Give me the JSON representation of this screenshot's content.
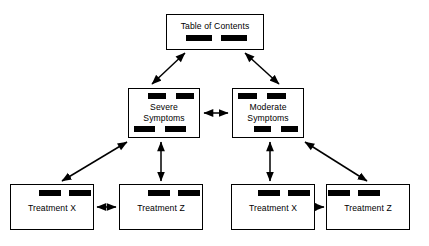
{
  "diagram": {
    "type": "hierarchy-tree",
    "background_color": "#ffffff",
    "line_color": "#000000",
    "bar_color": "#000000",
    "nodes": {
      "toc": {
        "label": "Table of Contents",
        "bars_top": 0,
        "bars_bottom": 2
      },
      "severe": {
        "label": "Severe\nSymptoms",
        "bars_top": 2,
        "bars_bottom": 2
      },
      "moderate": {
        "label": "Moderate\nSymptoms",
        "bars_top": 2,
        "bars_bottom": 2
      },
      "treatment_x_left": {
        "label": "Treatment X",
        "bars_top": 2,
        "bars_bottom": 0
      },
      "treatment_z_left": {
        "label": "Treatment Z",
        "bars_top": 2,
        "bars_bottom": 0
      },
      "treatment_x_right": {
        "label": "Treatment X",
        "bars_top": 2,
        "bars_bottom": 0
      },
      "treatment_z_right": {
        "label": "Treatment Z",
        "bars_top": 2,
        "bars_bottom": 0
      }
    },
    "connections": [
      {
        "from": "toc",
        "to": "severe",
        "style": "double-arrow",
        "orientation": "diagonal"
      },
      {
        "from": "toc",
        "to": "moderate",
        "style": "double-arrow",
        "orientation": "diagonal"
      },
      {
        "from": "severe",
        "to": "moderate",
        "style": "double-arrow",
        "orientation": "horizontal"
      },
      {
        "from": "severe",
        "to": "treatment_x_left",
        "style": "double-arrow",
        "orientation": "diagonal"
      },
      {
        "from": "severe",
        "to": "treatment_z_left",
        "style": "double-arrow",
        "orientation": "vertical"
      },
      {
        "from": "moderate",
        "to": "treatment_z_right",
        "style": "double-arrow",
        "orientation": "diagonal"
      },
      {
        "from": "moderate",
        "to": "treatment_x_right",
        "style": "double-arrow",
        "orientation": "vertical"
      },
      {
        "from": "treatment_x_left",
        "to": "treatment_z_left",
        "style": "double-arrow",
        "orientation": "horizontal"
      },
      {
        "from": "treatment_x_right",
        "to": "treatment_z_right",
        "style": "double-arrow",
        "orientation": "horizontal"
      }
    ]
  }
}
